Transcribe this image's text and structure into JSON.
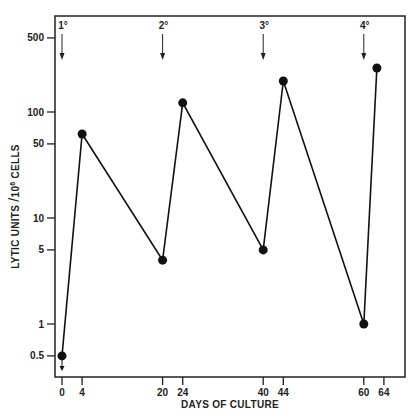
{
  "chart_data": {
    "type": "line",
    "title": "",
    "xlabel": "DAYS OF CULTURE",
    "ylabel": "LYTIC UNITS / 10^6 CELLS",
    "ylabel_parts": {
      "pre": "LYTIC UNITS",
      "slash": "/",
      "base": "10",
      "exp": "6",
      "post": "CELLS"
    },
    "yscale": "log",
    "ylim": [
      0.35,
      900
    ],
    "xlim": [
      -1.5,
      69
    ],
    "x_ticks": [
      0,
      4,
      20,
      24,
      40,
      44,
      60,
      64
    ],
    "y_ticks": [
      {
        "value": 0.5,
        "label": "0.5"
      },
      {
        "value": 1,
        "label": "1"
      },
      {
        "value": 5,
        "label": "5"
      },
      {
        "value": 10,
        "label": "10"
      },
      {
        "value": 50,
        "label": "50"
      },
      {
        "value": 100,
        "label": "100"
      },
      {
        "value": 500,
        "label": "500"
      }
    ],
    "grid": false,
    "legend": null,
    "series": [
      {
        "name": "Lytic activity",
        "x": [
          0,
          4,
          20,
          24,
          40,
          44,
          60,
          62.6
        ],
        "values": [
          0.5,
          62,
          4,
          122,
          5,
          196,
          1,
          260
        ]
      }
    ],
    "annotations": [
      {
        "label": "1°",
        "x": 0,
        "type": "stimulation-arrow"
      },
      {
        "label": "2°",
        "x": 20,
        "type": "stimulation-arrow"
      },
      {
        "label": "3°",
        "x": 40,
        "type": "stimulation-arrow"
      },
      {
        "label": "4°",
        "x": 60,
        "type": "stimulation-arrow"
      }
    ],
    "below_detection_marker": {
      "x": 0,
      "note": "downward arrow under first point"
    }
  },
  "layout": {
    "plot": {
      "left": 55,
      "top": 16,
      "right": 405,
      "bottom": 377
    },
    "x0_px": 62,
    "px_per_day": 5.03,
    "y100_px": 112,
    "px_per_decade": 106
  }
}
